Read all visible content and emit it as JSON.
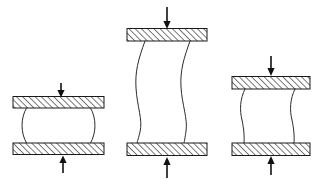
{
  "figure": {
    "canvas": {
      "width": 317,
      "height": 187,
      "background": "#ffffff"
    },
    "style": {
      "line_color": "#2b2b2b",
      "platen_outline_color": "#1a1a1a",
      "hatch_color": "#1a1a1a",
      "arrow_color": "#111111",
      "hatch_angle_deg": 45,
      "hatch_spacing_px": 3.2,
      "platen_fill": "hatched"
    },
    "specimens": [
      {
        "name": "barrelled-specimen",
        "label": "",
        "mode": "barrelling",
        "aspect": "short-stocky",
        "top_platen": {
          "x": 13,
          "y": 96,
          "width": 91,
          "height": 12
        },
        "bottom_platen": {
          "x": 13,
          "y": 143,
          "width": 91,
          "height": 12
        },
        "specimen": {
          "top_y": 108,
          "bottom_y": 143,
          "left_x": 26,
          "right_x": 91,
          "bulge_px": 7
        },
        "top_arrow": {
          "x": 61,
          "y_start": 83,
          "y_end": 96,
          "direction": "down"
        },
        "bottom_arrow": {
          "x": 63,
          "y_start": 173,
          "y_end": 156,
          "direction": "up"
        }
      },
      {
        "name": "buckled-slender-specimen",
        "label": "",
        "mode": "buckling",
        "aspect": "tall-slender",
        "top_platen": {
          "x": 127,
          "y": 28,
          "width": 80,
          "height": 13
        },
        "bottom_platen": {
          "x": 127,
          "y": 143,
          "width": 80,
          "height": 13
        },
        "specimen": {
          "top_y": 41,
          "bottom_y": 143,
          "left_x": 145,
          "right_x": 190,
          "sway_px": 9
        },
        "top_arrow": {
          "x": 167,
          "y_start": 7,
          "y_end": 28,
          "direction": "down"
        },
        "bottom_arrow": {
          "x": 167,
          "y_start": 178,
          "y_end": 158,
          "direction": "up"
        }
      },
      {
        "name": "buckled-intermediate-specimen",
        "label": "",
        "mode": "mild-buckling",
        "aspect": "intermediate",
        "top_platen": {
          "x": 232,
          "y": 76,
          "width": 78,
          "height": 13
        },
        "bottom_platen": {
          "x": 232,
          "y": 143,
          "width": 78,
          "height": 13
        },
        "specimen": {
          "top_y": 89,
          "bottom_y": 143,
          "left_x": 245,
          "right_x": 295,
          "sway_px": 5
        },
        "top_arrow": {
          "x": 271,
          "y_start": 56,
          "y_end": 76,
          "direction": "down"
        },
        "bottom_arrow": {
          "x": 271,
          "y_start": 175,
          "y_end": 157,
          "direction": "up"
        }
      }
    ],
    "annotations": []
  }
}
